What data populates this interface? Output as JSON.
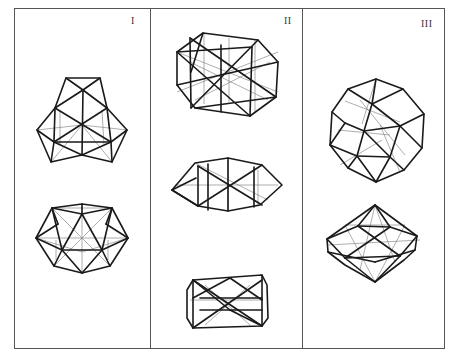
{
  "figure": {
    "frame_color": "#555555",
    "panels": [
      {
        "label": "I",
        "models": [
          {
            "name": "upper-model",
            "shape": "truncated-tetrahedral-wireframe"
          },
          {
            "name": "lower-model",
            "shape": "icosahedral-wireframe"
          }
        ]
      },
      {
        "label": "II",
        "models": [
          {
            "name": "upper-model",
            "shape": "cuboctahedral-wireframe"
          },
          {
            "name": "middle-model",
            "shape": "flattened-wireframe"
          },
          {
            "name": "lower-model",
            "shape": "elongated-box-wireframe"
          }
        ]
      },
      {
        "label": "III",
        "models": [
          {
            "name": "upper-model",
            "shape": "icosidodecahedral-wireframe"
          },
          {
            "name": "lower-model",
            "shape": "bipyramidal-wireframe"
          }
        ]
      }
    ]
  }
}
